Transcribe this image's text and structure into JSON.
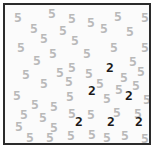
{
  "task": {
    "name": "visual-search-array",
    "description": "Feature search display: dark target digits among light gray distractor digits",
    "distractor_symbol": "5",
    "target_symbol": "2",
    "distractor_count": 48,
    "target_count": 6,
    "total_items": 54
  },
  "colors": {
    "background": "#fbfbfb",
    "page": "#ffffff",
    "border": "#2b2b2b",
    "distractor": "#b9b9b9",
    "target": "#1a1a1a"
  },
  "panel": {
    "x": 3,
    "y": 3,
    "width": 148,
    "height": 142,
    "border_width": 2
  },
  "items": [
    {
      "symbol": "5",
      "role": "distractor",
      "x": 11,
      "y": 8
    },
    {
      "symbol": "5",
      "role": "distractor",
      "x": 45,
      "y": 4
    },
    {
      "symbol": "5",
      "role": "distractor",
      "x": 65,
      "y": 9
    },
    {
      "symbol": "5",
      "role": "distractor",
      "x": 84,
      "y": 13
    },
    {
      "symbol": "5",
      "role": "distractor",
      "x": 111,
      "y": 7
    },
    {
      "symbol": "5",
      "role": "distractor",
      "x": 138,
      "y": 8
    },
    {
      "symbol": "5",
      "role": "distractor",
      "x": 27,
      "y": 19
    },
    {
      "symbol": "5",
      "role": "distractor",
      "x": 56,
      "y": 21
    },
    {
      "symbol": "5",
      "role": "distractor",
      "x": 97,
      "y": 19
    },
    {
      "symbol": "5",
      "role": "distractor",
      "x": 123,
      "y": 22
    },
    {
      "symbol": "5",
      "role": "distractor",
      "x": 37,
      "y": 29
    },
    {
      "symbol": "5",
      "role": "distractor",
      "x": 68,
      "y": 31
    },
    {
      "symbol": "5",
      "role": "distractor",
      "x": 14,
      "y": 38
    },
    {
      "symbol": "5",
      "role": "distractor",
      "x": 107,
      "y": 38
    },
    {
      "symbol": "5",
      "role": "distractor",
      "x": 138,
      "y": 38
    },
    {
      "symbol": "5",
      "role": "distractor",
      "x": 46,
      "y": 44
    },
    {
      "symbol": "5",
      "role": "distractor",
      "x": 80,
      "y": 44
    },
    {
      "symbol": "5",
      "role": "distractor",
      "x": 30,
      "y": 51
    },
    {
      "symbol": "5",
      "role": "distractor",
      "x": 126,
      "y": 52
    },
    {
      "symbol": "5",
      "role": "distractor",
      "x": 65,
      "y": 58
    },
    {
      "symbol": "5",
      "role": "distractor",
      "x": 19,
      "y": 65
    },
    {
      "symbol": "5",
      "role": "distractor",
      "x": 53,
      "y": 63
    },
    {
      "symbol": "5",
      "role": "distractor",
      "x": 82,
      "y": 64
    },
    {
      "symbol": "2",
      "role": "target",
      "x": 103,
      "y": 58
    },
    {
      "symbol": "5",
      "role": "distractor",
      "x": 117,
      "y": 68
    },
    {
      "symbol": "5",
      "role": "distractor",
      "x": 134,
      "y": 62
    },
    {
      "symbol": "5",
      "role": "distractor",
      "x": 37,
      "y": 74
    },
    {
      "symbol": "5",
      "role": "distractor",
      "x": 62,
      "y": 72
    },
    {
      "symbol": "5",
      "role": "distractor",
      "x": 93,
      "y": 74
    },
    {
      "symbol": "5",
      "role": "distractor",
      "x": 129,
      "y": 76
    },
    {
      "symbol": "5",
      "role": "distractor",
      "x": 112,
      "y": 80
    },
    {
      "symbol": "5",
      "role": "distractor",
      "x": 10,
      "y": 86
    },
    {
      "symbol": "5",
      "role": "distractor",
      "x": 63,
      "y": 87
    },
    {
      "symbol": "2",
      "role": "target",
      "x": 85,
      "y": 81
    },
    {
      "symbol": "5",
      "role": "distractor",
      "x": 100,
      "y": 89
    },
    {
      "symbol": "2",
      "role": "target",
      "x": 122,
      "y": 86
    },
    {
      "symbol": "5",
      "role": "distractor",
      "x": 140,
      "y": 90
    },
    {
      "symbol": "5",
      "role": "distractor",
      "x": 28,
      "y": 95
    },
    {
      "symbol": "5",
      "role": "distractor",
      "x": 47,
      "y": 97
    },
    {
      "symbol": "5",
      "role": "distractor",
      "x": 17,
      "y": 105
    },
    {
      "symbol": "5",
      "role": "distractor",
      "x": 36,
      "y": 108
    },
    {
      "symbol": "5",
      "role": "distractor",
      "x": 65,
      "y": 104
    },
    {
      "symbol": "5",
      "role": "distractor",
      "x": 84,
      "y": 105
    },
    {
      "symbol": "5",
      "role": "distractor",
      "x": 110,
      "y": 103
    },
    {
      "symbol": "5",
      "role": "distractor",
      "x": 131,
      "y": 104
    },
    {
      "symbol": "2",
      "role": "target",
      "x": 72,
      "y": 112
    },
    {
      "symbol": "2",
      "role": "target",
      "x": 104,
      "y": 112
    },
    {
      "symbol": "2",
      "role": "target",
      "x": 132,
      "y": 112
    },
    {
      "symbol": "5",
      "role": "distractor",
      "x": 12,
      "y": 117
    },
    {
      "symbol": "5",
      "role": "distractor",
      "x": 47,
      "y": 118
    },
    {
      "symbol": "5",
      "role": "distractor",
      "x": 23,
      "y": 128
    },
    {
      "symbol": "5",
      "role": "distractor",
      "x": 43,
      "y": 128
    },
    {
      "symbol": "5",
      "role": "distractor",
      "x": 64,
      "y": 126
    },
    {
      "symbol": "5",
      "role": "distractor",
      "x": 85,
      "y": 125
    },
    {
      "symbol": "5",
      "role": "distractor",
      "x": 100,
      "y": 128
    },
    {
      "symbol": "5",
      "role": "distractor",
      "x": 118,
      "y": 126
    },
    {
      "symbol": "5",
      "role": "distractor",
      "x": 138,
      "y": 129
    }
  ]
}
